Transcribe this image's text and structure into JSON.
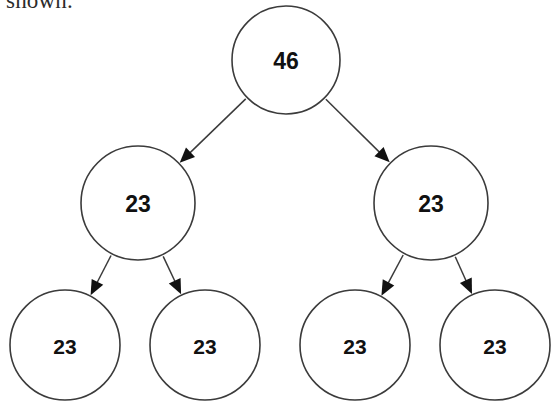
{
  "caption": {
    "text": "shown."
  },
  "diagram": {
    "type": "binary-tree",
    "background_color": "#ffffff",
    "node_fill": "#ffffff",
    "node_stroke": "#3b3b3b",
    "label_color": "#111111",
    "edge_color": "#3b3b3b",
    "nodes": [
      {
        "id": "root",
        "label": "46",
        "level": 0,
        "cx": 286,
        "cy": 60,
        "r": 54
      },
      {
        "id": "mid-l",
        "label": "23",
        "level": 1,
        "cx": 138,
        "cy": 203,
        "r": 57
      },
      {
        "id": "mid-r",
        "label": "23",
        "level": 1,
        "cx": 431,
        "cy": 203,
        "r": 57
      },
      {
        "id": "leaf-1",
        "label": "23",
        "level": 2,
        "cx": 65,
        "cy": 345,
        "r": 55
      },
      {
        "id": "leaf-2",
        "label": "23",
        "level": 2,
        "cx": 205,
        "cy": 345,
        "r": 55
      },
      {
        "id": "leaf-3",
        "label": "23",
        "level": 2,
        "cx": 355,
        "cy": 345,
        "r": 55
      },
      {
        "id": "leaf-4",
        "label": "23",
        "level": 2,
        "cx": 495,
        "cy": 345,
        "r": 55
      }
    ],
    "edges": [
      {
        "from": "root",
        "to": "mid-l",
        "arrow": true
      },
      {
        "from": "root",
        "to": "mid-r",
        "arrow": true
      },
      {
        "from": "mid-l",
        "to": "leaf-1",
        "arrow": true
      },
      {
        "from": "mid-l",
        "to": "leaf-2",
        "arrow": true
      },
      {
        "from": "mid-r",
        "to": "leaf-3",
        "arrow": true
      },
      {
        "from": "mid-r",
        "to": "leaf-4",
        "arrow": true
      }
    ]
  }
}
